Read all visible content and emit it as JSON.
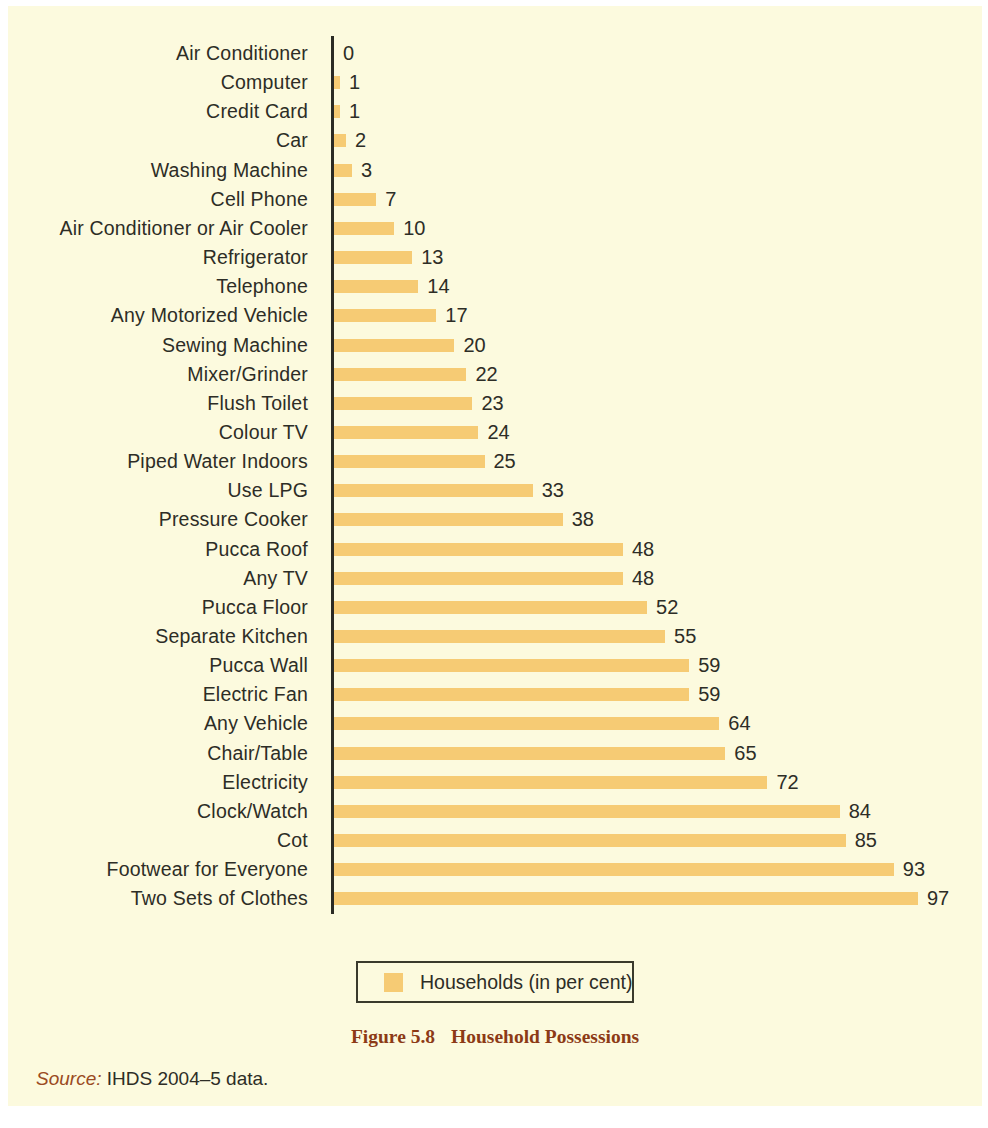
{
  "figure": {
    "caption_number": "Figure 5.8",
    "caption_title": "Household Possessions",
    "source_label": "Source:",
    "source_text": " IHDS 2004–5 data."
  },
  "legend": {
    "swatch_name": "legend-color-swatch",
    "label": "Households (in per cent)"
  },
  "colors": {
    "bar": "#f6cb74",
    "background": "#fcfade",
    "text": "#2d2d26",
    "caption": "#8c3a16",
    "axis": "#2b2b24"
  },
  "chart_data": {
    "type": "bar",
    "orientation": "horizontal",
    "title": "Household Possessions",
    "xlabel": "",
    "ylabel": "",
    "xlim": [
      0,
      100
    ],
    "grid": false,
    "legend_position": "bottom",
    "series": [
      {
        "name": "Households (in per cent)",
        "values": [
          0,
          1,
          1,
          2,
          3,
          7,
          10,
          13,
          14,
          17,
          20,
          22,
          23,
          24,
          25,
          33,
          38,
          48,
          48,
          52,
          55,
          59,
          59,
          64,
          65,
          72,
          84,
          85,
          93,
          97
        ]
      }
    ],
    "categories": [
      "Air Conditioner",
      "Computer",
      "Credit Card",
      "Car",
      "Washing Machine",
      "Cell Phone",
      "Air Conditioner or Air Cooler",
      "Refrigerator",
      "Telephone",
      "Any Motorized Vehicle",
      "Sewing Machine",
      "Mixer/Grinder",
      "Flush Toilet",
      "Colour TV",
      "Piped Water Indoors",
      "Use LPG",
      "Pressure Cooker",
      "Pucca Roof",
      "Any TV",
      "Pucca Floor",
      "Separate Kitchen",
      "Pucca Wall",
      "Electric Fan",
      "Any Vehicle",
      "Chair/Table",
      "Electricity",
      "Clock/Watch",
      "Cot",
      "Footwear for Everyone",
      "Two Sets of Clothes"
    ],
    "value_labels": [
      "0",
      "1",
      "1",
      "2",
      "3",
      "7",
      "10",
      "13",
      "14",
      "17",
      "20",
      "22",
      "23",
      "24",
      "25",
      "33",
      "38",
      "48",
      "48",
      "52",
      "55",
      "59",
      "59",
      "64",
      "65",
      "72",
      "84",
      "85",
      "93",
      "97"
    ]
  }
}
